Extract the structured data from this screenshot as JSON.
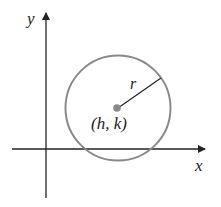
{
  "diagram": {
    "axes": {
      "x_label": "x",
      "y_label": "y"
    },
    "circle": {
      "center_label": "(h, k)",
      "radius_label": "r",
      "stroke_color": "#8a8a8a",
      "center_color": "#8a8a8a"
    },
    "axis_color": "#222222"
  }
}
